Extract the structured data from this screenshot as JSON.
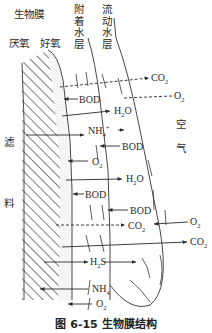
{
  "figure": {
    "caption": "图 6-15   生物膜结构",
    "title": "生物膜结构"
  },
  "labels": {
    "biofilm": "生物膜",
    "anaerobic": "厌氧",
    "aerobic": "好氧",
    "attached_water_layer": [
      "附",
      "着",
      "水",
      "层"
    ],
    "flowing_water_layer": [
      "流",
      "动",
      "水",
      "层"
    ],
    "filter_media": [
      "滤",
      "料"
    ],
    "air": [
      "空",
      "气"
    ]
  },
  "layers": [
    {
      "name": "滤料",
      "pattern": "hatched"
    },
    {
      "name": "厌氧层",
      "pattern": "hatched"
    },
    {
      "name": "好氧层",
      "pattern": "stippled"
    },
    {
      "name": "附着水层",
      "pattern": "blank"
    },
    {
      "name": "流动水层",
      "pattern": "blank"
    },
    {
      "name": "空气",
      "pattern": "blank"
    }
  ],
  "chemicals": {
    "co2_top": "CO",
    "co2_top_sub": "2",
    "o2_top": "O",
    "o2_top_sub": "2",
    "bod_1": "BOD",
    "h2o_1": "H",
    "h2o_1_sub": "2",
    "h2o_1_tail": "O",
    "nh4_1": "NH",
    "nh4_1_sup": "+",
    "nh4_1_sub": "4",
    "bod_2": "BOD",
    "o2_mid": "O",
    "o2_mid_sub": "2",
    "h2o_2": "H",
    "h2o_2_sub": "2",
    "h2o_2_tail": "O",
    "bod_3": "BOD",
    "bod_4": "BOD",
    "co2_mid": "CO",
    "co2_mid_sub": "2",
    "o2_right": "O",
    "o2_right_sub": "2",
    "co2_right": "CO",
    "co2_right_sub": "2",
    "h2s": "H",
    "h2s_sub": "2",
    "h2s_tail": "S",
    "nh4_2": "NH",
    "nh4_2_sub": "4",
    "o2_bottom": "O",
    "o2_bottom_sub": "2"
  },
  "colors": {
    "ink": "#2a2a2a",
    "hatch": "#3a3a3a",
    "stipple": "#9a9a9a",
    "background": "#ffffff"
  }
}
